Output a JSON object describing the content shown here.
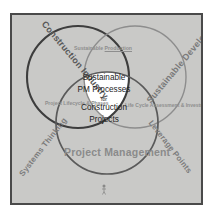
{
  "diagram": {
    "type": "venn",
    "background_color": "#c9c9c7",
    "frame_border_color": "#4a4a4a",
    "circles": [
      {
        "id": "construction-industry",
        "label": "Construction\nIndustry",
        "label_line1": "Construction",
        "label_line2": "Industry",
        "position": "left",
        "stroke_color": "#3d3d3d",
        "stroke_width": 2.1,
        "fill": "none"
      },
      {
        "id": "sustainable-development",
        "label": "Sustainable\nDevelopment",
        "label_line1": "Sustainable",
        "label_line2": "Development",
        "position": "right",
        "stroke_color": "#8a8a8a",
        "stroke_width": 1.4,
        "fill": "none"
      },
      {
        "id": "project-management",
        "label": "Project\nManagement",
        "label_line1": "Project",
        "label_line2": "Management",
        "position": "bottom",
        "stroke_color": "#5a5a5a",
        "stroke_width": 1.6,
        "fill": "none"
      }
    ],
    "intersections": {
      "top": {
        "id": "top-intersection",
        "line1": "Sustainable",
        "line2": "Production"
      },
      "left": {
        "id": "left-intersection",
        "line1": "Project",
        "line2": "Lifecycle",
        "line3": "& Phases"
      },
      "right": {
        "id": "right-intersection",
        "line1": "Life",
        "line2": "Cycle",
        "line3": "Assessment",
        "line4": "& Investment",
        "line5": "Areas"
      }
    },
    "center": {
      "id": "center-core",
      "line1": "Sustainable",
      "line2": "PM Processes",
      "line3": "for",
      "line4": "Construction",
      "line5": "Projects",
      "fill_color": "#ffffff"
    },
    "corner_labels": {
      "bottom_left": "Systems Thinking",
      "bottom_right": "Leverage Points"
    },
    "bottom_mark": "figure-mark"
  }
}
